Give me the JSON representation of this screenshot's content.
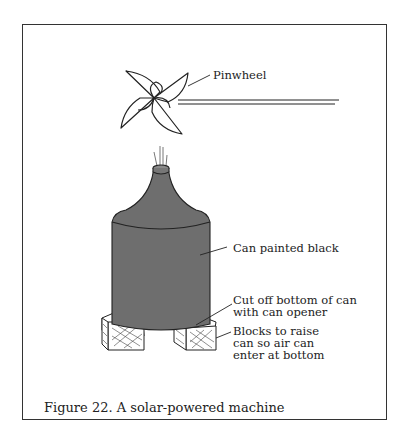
{
  "figure": {
    "caption": "Figure 22. A solar-powered machine",
    "labels": {
      "pinwheel": "Pinwheel",
      "can": "Can painted black",
      "bottom_line1": "Cut off bottom of can",
      "bottom_line2": "with can opener",
      "blocks_line1": "Blocks to raise",
      "blocks_line2": "can so air can",
      "blocks_line3": "enter at bottom"
    },
    "colors": {
      "can_fill": "#6e6e6e",
      "line": "#222222",
      "border": "#333333"
    }
  }
}
